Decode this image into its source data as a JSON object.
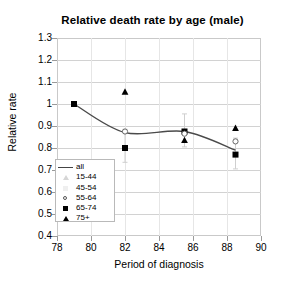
{
  "chart_data": {
    "type": "line",
    "title": "Relative death rate by age (male)",
    "xlabel": "Period of diagnosis",
    "ylabel": "Relative rate",
    "xlim": [
      78,
      90
    ],
    "ylim": [
      0.4,
      1.3
    ],
    "xticks": [
      78,
      80,
      82,
      84,
      86,
      88,
      90
    ],
    "yticks": [
      0.4,
      0.5,
      0.6,
      0.7,
      0.8,
      0.9,
      1.0,
      1.1,
      1.2,
      1.3
    ],
    "ytick_labels": [
      "0.4",
      "0.5",
      "0.6",
      "0.7",
      "0.8",
      "0.9",
      "1",
      "1.1",
      "1.2",
      "1.3"
    ],
    "xtick_labels": [
      "78",
      "80",
      "82",
      "84",
      "86",
      "88",
      "90"
    ],
    "grid": "horizontal",
    "legend_position": "lower-left-inside",
    "legend": [
      {
        "label": "all",
        "marker": "line"
      },
      {
        "label": "15-44",
        "marker": "open-triangle"
      },
      {
        "label": "45-54",
        "marker": "faint-square"
      },
      {
        "label": "55-64",
        "marker": "open-circle"
      },
      {
        "label": "65-74",
        "marker": "filled-square"
      },
      {
        "label": "75+",
        "marker": "filled-triangle"
      }
    ],
    "series": [
      {
        "name": "all",
        "marker": "line",
        "x": [
          79,
          82,
          85.5,
          88.5
        ],
        "values": [
          1.0,
          0.87,
          0.875,
          0.79
        ]
      },
      {
        "name": "65-74",
        "marker": "filled-square",
        "x": [
          79,
          82,
          85.5,
          88.5
        ],
        "values": [
          1.0,
          0.8,
          0.875,
          0.77
        ],
        "err_low": [
          1.0,
          0.735,
          0.805,
          0.705
        ],
        "err_high": [
          1.0,
          0.885,
          0.955,
          0.845
        ]
      },
      {
        "name": "75+",
        "marker": "filled-triangle",
        "x": [
          82,
          85.5,
          88.5
        ],
        "values": [
          1.055,
          0.835,
          0.89
        ]
      },
      {
        "name": "55-64",
        "marker": "open-circle",
        "x": [
          82,
          85.5,
          88.5
        ],
        "values": [
          0.875,
          0.865,
          0.83
        ]
      }
    ]
  }
}
